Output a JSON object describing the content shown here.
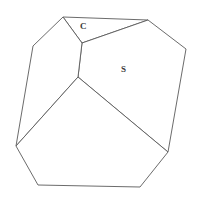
{
  "figure": {
    "kind": "crystal-form-line-drawing",
    "width": 203,
    "height": 200,
    "background_color": "#ffffff",
    "stroke_color": "#5a5a5a",
    "label_color": "#3b3b3b"
  },
  "labels": {
    "c_face": "C",
    "s_face": "S"
  },
  "geometry": {
    "vertices": {
      "top_apex": [
        63,
        17
      ],
      "top_right": [
        148,
        20
      ],
      "c_lower": [
        82,
        43
      ],
      "upper_left": [
        33,
        46
      ],
      "right": [
        186,
        49
      ],
      "center": [
        78,
        77
      ],
      "left": [
        16,
        146
      ],
      "lower_right": [
        168,
        152
      ],
      "bottom_left": [
        38,
        185
      ],
      "bottom_right": [
        140,
        187
      ]
    },
    "faces": [
      {
        "name": "c-face",
        "label": "C",
        "points": "63,17 148,20 82,43"
      },
      {
        "name": "s-face",
        "label": "S",
        "points": "82,43 148,20 186,49 168,152 78,77"
      },
      {
        "name": "left-upper-face",
        "label": "",
        "points": "63,17 82,43 78,77 16,146 33,46"
      },
      {
        "name": "bottom-face",
        "label": "",
        "points": "78,77 168,152 140,187 38,185 16,146"
      }
    ]
  }
}
